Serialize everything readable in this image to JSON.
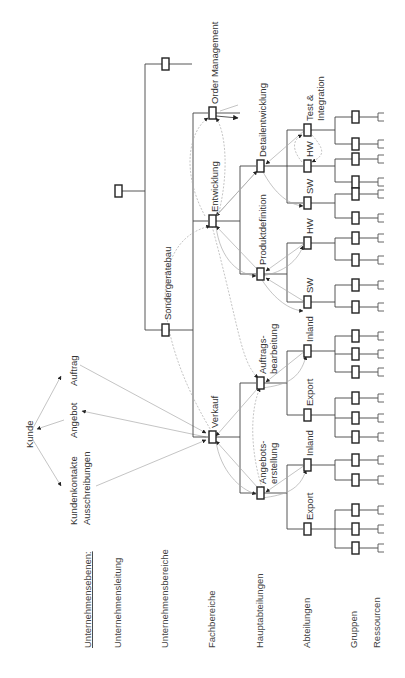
{
  "levels": {
    "header": "Unternehmensebenen:",
    "items": [
      "Unternehmensleitung",
      "Unternehmensbereiche",
      "Fachbereiche",
      "Hauptabteilungen",
      "Abteilungen",
      "Gruppen",
      "Ressourcen"
    ]
  },
  "customer": {
    "kunde": "Kunde",
    "kundenkontakte": "Kundenkontakte",
    "ausschreibungen": "Ausschreibungen",
    "angebot": "Angebot",
    "auftrag": "Auftrag"
  },
  "units": {
    "sondergeraetebau": "Sondergerätebau",
    "verkauf": "Verkauf",
    "entwicklung": "Entwicklung",
    "order_management": "Order Management",
    "angebots_1": "Angebots-",
    "angebots_2": "erstellung",
    "auftrags_1": "Auftrags-",
    "auftrags_2": "bearbeitung",
    "produktdefinition": "Produktdefinition",
    "detailentwicklung": "Detailentwicklung",
    "export_a": "Export",
    "inland_a": "Inland",
    "export_b": "Export",
    "inland_b": "Inland",
    "sw_a": "SW",
    "hw_a": "HW",
    "sw_b": "SW",
    "hw_b": "HW",
    "test_1": "Test &",
    "test_2": "Integration"
  },
  "colors": {
    "line": "#444444",
    "flow": "#aaaaaa",
    "box_stroke": "#222222"
  }
}
